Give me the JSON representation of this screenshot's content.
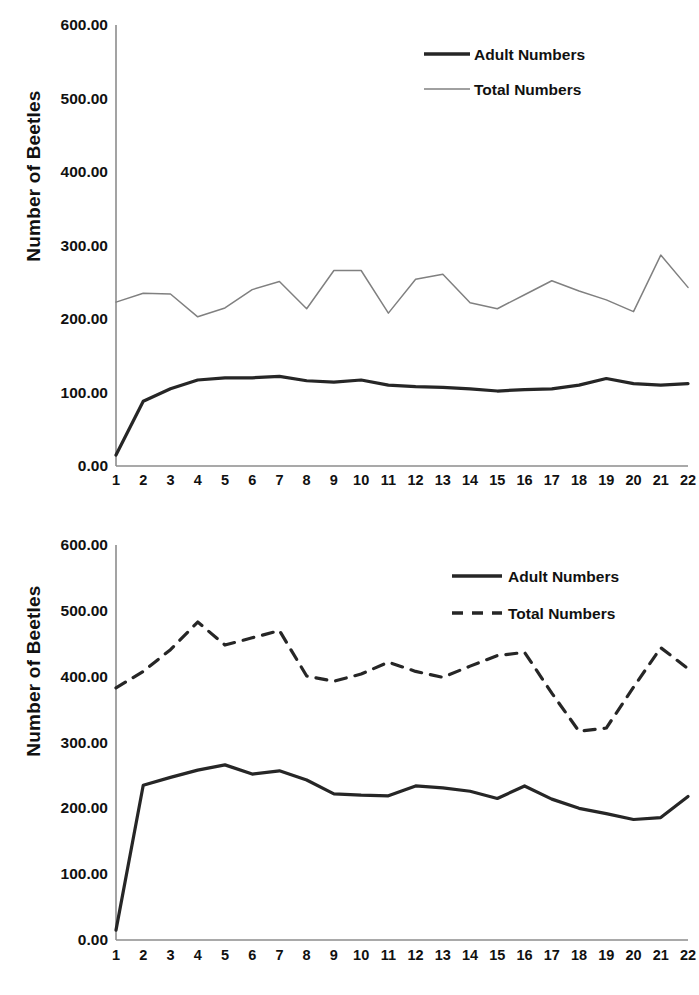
{
  "chart_data": [
    {
      "panel": "top",
      "type": "line",
      "title": "",
      "xlabel": "",
      "ylabel": "Number of Beetles",
      "xlim": [
        1,
        22
      ],
      "ylim": [
        0,
        600
      ],
      "ytick_labels": [
        "600.00",
        "500.00",
        "400.00",
        "300.00",
        "200.00",
        "100.00",
        "0.00"
      ],
      "ytick_values": [
        600,
        500,
        400,
        300,
        200,
        100,
        0
      ],
      "grid": false,
      "legend_position": "top-right",
      "x": [
        1,
        2,
        3,
        4,
        5,
        6,
        7,
        8,
        9,
        10,
        11,
        12,
        13,
        14,
        15,
        16,
        17,
        18,
        19,
        20,
        21,
        22
      ],
      "xtick_labels": [
        "1",
        "2",
        "3",
        "4",
        "5",
        "6",
        "7",
        "8",
        "9",
        "10",
        "11",
        "12",
        "13",
        "14",
        "15",
        "16",
        "17",
        "18",
        "19",
        "20",
        "21",
        "22"
      ],
      "series": [
        {
          "name": "Adult Numbers",
          "style": "solid",
          "width": 3.2,
          "color": "#262626",
          "values": [
            15,
            88,
            105,
            117,
            120,
            120,
            122,
            116,
            114,
            117,
            110,
            108,
            107,
            105,
            102,
            104,
            105,
            110,
            119,
            112,
            110,
            112
          ]
        },
        {
          "name": "Total Numbers",
          "style": "solid",
          "width": 1.5,
          "color": "#808080",
          "values": [
            223,
            235,
            234,
            203,
            215,
            240,
            251,
            214,
            266,
            266,
            208,
            254,
            261,
            222,
            214,
            233,
            252,
            238,
            226,
            210,
            287,
            243
          ]
        }
      ]
    },
    {
      "panel": "bottom",
      "type": "line",
      "title": "",
      "xlabel": "",
      "ylabel": "Number of Beetles",
      "xlim": [
        1,
        22
      ],
      "ylim": [
        0,
        600
      ],
      "ytick_labels": [
        "600.00",
        "500.00",
        "400.00",
        "300.00",
        "200.00",
        "100.00",
        "0.00"
      ],
      "ytick_values": [
        600,
        500,
        400,
        300,
        200,
        100,
        0
      ],
      "grid": false,
      "legend_position": "top-right",
      "x": [
        1,
        2,
        3,
        4,
        5,
        6,
        7,
        8,
        9,
        10,
        11,
        12,
        13,
        14,
        15,
        16,
        17,
        18,
        19,
        20,
        21,
        22
      ],
      "xtick_labels": [
        "1",
        "2",
        "3",
        "4",
        "5",
        "6",
        "7",
        "8",
        "9",
        "10",
        "11",
        "12",
        "13",
        "14",
        "15",
        "16",
        "17",
        "18",
        "19",
        "20",
        "21",
        "22"
      ],
      "series": [
        {
          "name": "Adult Numbers",
          "style": "solid",
          "width": 3.2,
          "color": "#262626",
          "values": [
            15,
            235,
            247,
            258,
            266,
            252,
            257,
            243,
            222,
            220,
            219,
            234,
            231,
            226,
            215,
            234,
            214,
            200,
            192,
            183,
            186,
            218
          ]
        },
        {
          "name": "Total Numbers",
          "style": "dashed",
          "width": 3.2,
          "color": "#262626",
          "values": [
            383,
            408,
            441,
            483,
            448,
            459,
            470,
            401,
            393,
            404,
            422,
            408,
            399,
            416,
            432,
            437,
            375,
            317,
            322,
            384,
            444,
            412
          ]
        }
      ]
    }
  ],
  "legend_top": {
    "adult_label": "Adult Numbers",
    "total_label": "Total Numbers"
  },
  "legend_bottom": {
    "adult_label": "Adult Numbers",
    "total_label": "Total Numbers"
  },
  "axis_top": {
    "ylabel": "Number of Beetles",
    "yticks": [
      "600.00",
      "500.00",
      "400.00",
      "300.00",
      "200.00",
      "100.00",
      "0.00"
    ],
    "xticks": [
      "1",
      "2",
      "3",
      "4",
      "5",
      "6",
      "7",
      "8",
      "9",
      "10",
      "11",
      "12",
      "13",
      "14",
      "15",
      "16",
      "17",
      "18",
      "19",
      "20",
      "21",
      "22"
    ]
  },
  "axis_bottom": {
    "ylabel": "Number of Beetles",
    "yticks": [
      "600.00",
      "500.00",
      "400.00",
      "300.00",
      "200.00",
      "100.00",
      "0.00"
    ],
    "xticks": [
      "1",
      "2",
      "3",
      "4",
      "5",
      "6",
      "7",
      "8",
      "9",
      "10",
      "11",
      "12",
      "13",
      "14",
      "15",
      "16",
      "17",
      "18",
      "19",
      "20",
      "21",
      "22"
    ]
  },
  "colors": {
    "adult": "#262626",
    "total_top": "#808080",
    "total_bottom": "#262626",
    "axis": "#8c8c8c",
    "text": "#111111"
  }
}
